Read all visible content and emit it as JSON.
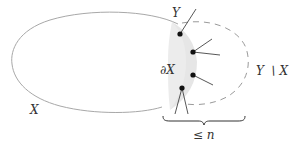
{
  "diagram": {
    "type": "set-diagram",
    "colors": {
      "outline": "#a8a8a8",
      "dashed": "#9a9a9a",
      "shade": "#e6e6e6",
      "point": "#111111",
      "edge": "#444444",
      "text": "#333333"
    },
    "labels": {
      "set_x": "X",
      "set_y": "Y",
      "boundary": "∂X",
      "difference": "Y ∖ X",
      "bound": "≤ n"
    },
    "regions": [
      {
        "name": "X",
        "style": "solid-ellipse"
      },
      {
        "name": "∂X",
        "style": "shaded-crescent"
      },
      {
        "name": "Y ∖ X",
        "style": "dashed-curve"
      }
    ],
    "points": [
      {
        "id": "p1",
        "edges": 1
      },
      {
        "id": "p2",
        "edges": 2
      },
      {
        "id": "p3",
        "edges": 1
      },
      {
        "id": "p4",
        "edges": 2
      }
    ],
    "brace": {
      "label": "≤ n",
      "orientation": "bottom"
    }
  }
}
